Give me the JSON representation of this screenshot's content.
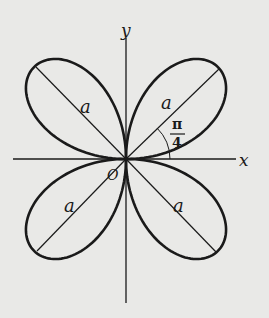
{
  "diagram": {
    "type": "four-leaf rose (polar curve)",
    "axes": {
      "x_label": "x",
      "y_label": "y"
    },
    "origin_label": "O",
    "petal_length_label": "a",
    "angle_label": {
      "numerator": "π",
      "denominator": "4"
    },
    "petals": [
      {
        "direction_deg": 45,
        "label": "a"
      },
      {
        "direction_deg": 135,
        "label": "a"
      },
      {
        "direction_deg": 225,
        "label": "a"
      },
      {
        "direction_deg": 315,
        "label": "a"
      }
    ],
    "colors": {
      "background": "#e9e9e7",
      "ink": "#1a1a1a"
    }
  }
}
